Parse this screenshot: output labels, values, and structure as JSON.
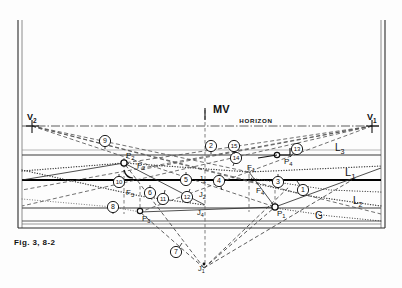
{
  "figure": {
    "caption": "Fig. 3, 8-2",
    "horizon_label": "HORIZON",
    "measuring_point_label": "MV"
  },
  "frame": {
    "left_x": 18,
    "right_x": 385,
    "top_y": 20,
    "bottom_y": 228
  },
  "lines": [
    {
      "name": "L3",
      "label": "L3",
      "y": 155,
      "weight": 1.2,
      "style": "solid",
      "color": "#3a3a3a"
    },
    {
      "name": "L1",
      "label": "L1",
      "y": 180,
      "weight": 2.2,
      "style": "solid",
      "color": "#000000"
    },
    {
      "name": "L2",
      "label": "L2",
      "y": 208,
      "weight": 1.2,
      "style": "solid",
      "color": "#3a3a3a"
    },
    {
      "name": "G",
      "label": "G",
      "y": 221,
      "weight": 1.0,
      "style": "solid",
      "color": "#5a5a5a"
    },
    {
      "name": "horizon",
      "label": "HORIZON",
      "y": 126,
      "weight": 0.9,
      "style": "dashdot",
      "color": "#444444"
    }
  ],
  "vanishing_points": [
    {
      "name": "V2",
      "label": "V2",
      "x": 32,
      "y": 126
    },
    {
      "name": "V1",
      "label": "V1",
      "x": 372,
      "y": 126
    }
  ],
  "measure_point": {
    "name": "MV",
    "label": "MV",
    "x": 210,
    "y": 113
  },
  "station_points": [
    {
      "name": "P1",
      "label": "P1",
      "x": 275,
      "y": 207
    },
    {
      "name": "P2",
      "label": "P2",
      "x": 124,
      "y": 163
    },
    {
      "name": "P3",
      "label": "P3",
      "x": 140,
      "y": 212
    },
    {
      "name": "P4",
      "label": "P4",
      "x": 282,
      "y": 155
    }
  ],
  "foot_points": [
    {
      "name": "F1",
      "label": "F1",
      "x": 249,
      "y": 172
    },
    {
      "name": "F2",
      "label": "F2",
      "x": 139,
      "y": 170
    },
    {
      "name": "F3",
      "label": "F3",
      "x": 128,
      "y": 186
    },
    {
      "name": "F4",
      "label": "F4",
      "x": 258,
      "y": 184
    }
  ],
  "joint_points": [
    {
      "name": "J1",
      "label": "J1",
      "x": 204,
      "y": 268
    },
    {
      "name": "J2",
      "label": "J2",
      "x": 205,
      "y": 194
    },
    {
      "name": "J3",
      "label": "J3",
      "x": 205,
      "y": 178
    },
    {
      "name": "J4",
      "label": "J4",
      "x": 203,
      "y": 212
    }
  ],
  "callouts": [
    {
      "id": 1,
      "label": "1",
      "cx": 303,
      "cy": 190,
      "tip_x": 297,
      "tip_y": 181
    },
    {
      "id": 2,
      "label": "2",
      "cx": 211,
      "cy": 146,
      "tip_x": 211,
      "tip_y": 154
    },
    {
      "id": 3,
      "label": "3",
      "cx": 278,
      "cy": 182,
      "tip_x": 278,
      "tip_y": 174
    },
    {
      "id": 4,
      "label": "4",
      "cx": 219,
      "cy": 181,
      "tip_x": 222,
      "tip_y": 190
    },
    {
      "id": 5,
      "label": "5",
      "cx": 186,
      "cy": 180,
      "tip_x": 186,
      "tip_y": 172
    },
    {
      "id": 6,
      "label": "6",
      "cx": 150,
      "cy": 193,
      "tip_x": 150,
      "tip_y": 185
    },
    {
      "id": 7,
      "label": "7",
      "cx": 176,
      "cy": 252,
      "tip_x": 182,
      "tip_y": 243
    },
    {
      "id": 8,
      "label": "8",
      "cx": 113,
      "cy": 207,
      "tip_x": 113,
      "tip_y": 214
    },
    {
      "id": 9,
      "label": "9",
      "cx": 105,
      "cy": 141,
      "tip_x": 105,
      "tip_y": 149
    },
    {
      "id": 10,
      "label": "10",
      "cx": 119,
      "cy": 182,
      "tip_x": 119,
      "tip_y": 174
    },
    {
      "id": 11,
      "label": "11",
      "cx": 163,
      "cy": 199,
      "tip_x": 165,
      "tip_y": 190
    },
    {
      "id": 12,
      "label": "12",
      "cx": 187,
      "cy": 197,
      "tip_x": 190,
      "tip_y": 189
    },
    {
      "id": 13,
      "label": "13",
      "cx": 297,
      "cy": 149,
      "tip_x": 290,
      "tip_y": 157
    },
    {
      "id": 14,
      "label": "14",
      "cx": 236,
      "cy": 158,
      "tip_x": 233,
      "tip_y": 166
    },
    {
      "id": 15,
      "label": "15",
      "cx": 234,
      "cy": 146,
      "tip_x": 234,
      "tip_y": 154
    }
  ],
  "colors": {
    "ink": "#111111",
    "rule": "#3a3a3a",
    "faint": "#6f6f6f",
    "paper": "#fdfdfd"
  }
}
